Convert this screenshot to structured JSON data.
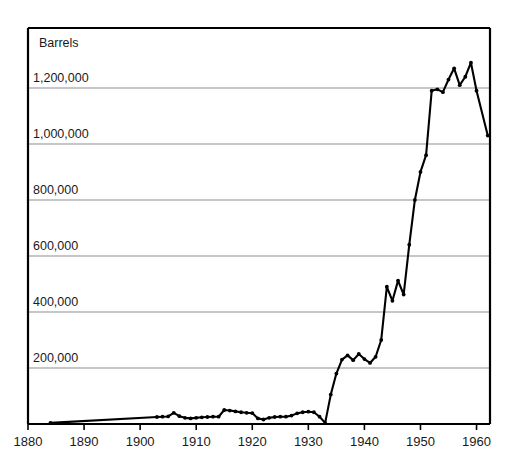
{
  "chart_data": {
    "type": "line",
    "title": "",
    "subtitle": "",
    "xlabel": "",
    "ylabel": "Barrels",
    "ylabel_position": "top-left-inside",
    "xlim": [
      1880,
      1962.4
    ],
    "ylim": [
      0,
      1414000
    ],
    "grid": "horizontal-only",
    "legend": "none",
    "series_name": "Barrels",
    "line_color": "#000000",
    "marker": "dot",
    "y_ticks": [
      200000,
      400000,
      600000,
      800000,
      1000000,
      1200000
    ],
    "y_tick_labels": [
      "200,000",
      "400,000",
      "600,000",
      "800,000",
      "1,000,000",
      "1,200,000"
    ],
    "x_ticks": [
      1880,
      1890,
      1900,
      1910,
      1920,
      1930,
      1940,
      1950,
      1960
    ],
    "x_tick_labels": [
      "1880",
      "1890",
      "1900",
      "1910",
      "1920",
      "1930",
      "1940",
      "1950",
      "1960"
    ],
    "x": [
      1884,
      1903,
      1904,
      1905,
      1906,
      1907,
      1908,
      1909,
      1910,
      1911,
      1912,
      1913,
      1914,
      1915,
      1916,
      1917,
      1918,
      1919,
      1920,
      1921,
      1922,
      1923,
      1924,
      1925,
      1926,
      1927,
      1928,
      1929,
      1930,
      1931,
      1932,
      1933,
      1934,
      1935,
      1936,
      1937,
      1938,
      1939,
      1940,
      1941,
      1942,
      1943,
      1944,
      1945,
      1946,
      1947,
      1948,
      1949,
      1950,
      1951,
      1952,
      1953,
      1954,
      1955,
      1956,
      1957,
      1958,
      1959,
      1960,
      1962
    ],
    "y": [
      4000,
      25000,
      26000,
      27000,
      40000,
      28000,
      22000,
      20000,
      22000,
      24000,
      25000,
      26000,
      26000,
      50000,
      48000,
      45000,
      42000,
      40000,
      39000,
      20000,
      16000,
      22000,
      25000,
      26000,
      26000,
      30000,
      38000,
      42000,
      44000,
      42000,
      26000,
      4000,
      105000,
      180000,
      230000,
      245000,
      228000,
      250000,
      232000,
      218000,
      240000,
      300000,
      490000,
      440000,
      512000,
      462000,
      640000,
      800000,
      900000,
      960000,
      1190000,
      1195000,
      1185000,
      1230000,
      1270000,
      1210000,
      1240000,
      1290000,
      1190000,
      1030000
    ]
  },
  "axes": {
    "y_title": "Barrels"
  }
}
